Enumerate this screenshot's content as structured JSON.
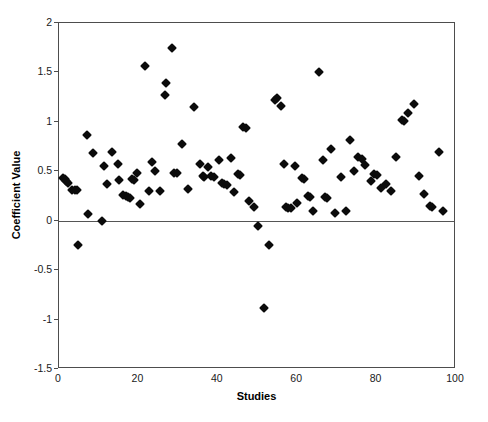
{
  "chart_data": {
    "type": "scatter",
    "title": "",
    "xlabel": "Studies",
    "ylabel": "Coefficient Value",
    "xlim": [
      0,
      100
    ],
    "ylim": [
      -1.5,
      2
    ],
    "xticks": [
      0,
      20,
      40,
      60,
      80,
      100
    ],
    "yticks": [
      -1.5,
      -1,
      -0.5,
      0,
      0.5,
      1,
      1.5,
      2
    ],
    "ytick_labels": [
      "-1.5",
      "-1",
      "-0.5",
      "0",
      "0.5",
      "1",
      "1.5",
      "2"
    ],
    "xtick_labels": [
      "0",
      "20",
      "40",
      "60",
      "80",
      "100"
    ],
    "grid": false,
    "legend": null,
    "marker": "diamond",
    "marker_color": "#0b0b0b",
    "zero_reference_line": 0,
    "series": [
      {
        "name": "Coefficient Value",
        "points": [
          [
            1.0,
            0.43
          ],
          [
            1.4,
            0.42
          ],
          [
            1.8,
            0.4
          ],
          [
            2.2,
            0.38
          ],
          [
            3.4,
            0.31
          ],
          [
            4.0,
            0.31
          ],
          [
            4.6,
            0.31
          ],
          [
            4.8,
            -0.25
          ],
          [
            7.0,
            0.87
          ],
          [
            7.2,
            0.07
          ],
          [
            8.6,
            0.69
          ],
          [
            10.8,
            0.0
          ],
          [
            11.4,
            0.55
          ],
          [
            12.0,
            0.37
          ],
          [
            13.4,
            0.7
          ],
          [
            14.8,
            0.57
          ],
          [
            15.2,
            0.41
          ],
          [
            16.2,
            0.26
          ],
          [
            16.8,
            0.25
          ],
          [
            17.4,
            0.24
          ],
          [
            17.8,
            0.23
          ],
          [
            18.4,
            0.42
          ],
          [
            19.0,
            0.41
          ],
          [
            19.6,
            0.48
          ],
          [
            20.4,
            0.17
          ],
          [
            21.6,
            1.57
          ],
          [
            22.6,
            0.3
          ],
          [
            23.4,
            0.59
          ],
          [
            24.2,
            0.5
          ],
          [
            25.4,
            0.3
          ],
          [
            26.6,
            1.27
          ],
          [
            27.0,
            1.39
          ],
          [
            28.4,
            1.75
          ],
          [
            29.0,
            0.48
          ],
          [
            29.6,
            0.48
          ],
          [
            31.0,
            0.78
          ],
          [
            32.4,
            0.32
          ],
          [
            34.0,
            1.15
          ],
          [
            35.4,
            0.57
          ],
          [
            36.2,
            0.45
          ],
          [
            36.6,
            0.44
          ],
          [
            37.6,
            0.54
          ],
          [
            38.4,
            0.45
          ],
          [
            39.0,
            0.44
          ],
          [
            40.2,
            0.61
          ],
          [
            41.0,
            0.38
          ],
          [
            41.6,
            0.37
          ],
          [
            42.2,
            0.36
          ],
          [
            43.2,
            0.63
          ],
          [
            44.2,
            0.29
          ],
          [
            45.0,
            0.47
          ],
          [
            45.6,
            0.46
          ],
          [
            46.4,
            0.95
          ],
          [
            47.0,
            0.94
          ],
          [
            47.8,
            0.2
          ],
          [
            49.0,
            0.14
          ],
          [
            50.2,
            -0.05
          ],
          [
            51.6,
            -0.88
          ],
          [
            53.0,
            -0.25
          ],
          [
            54.4,
            1.22
          ],
          [
            55.0,
            1.24
          ],
          [
            55.8,
            1.16
          ],
          [
            56.6,
            0.57
          ],
          [
            57.2,
            0.14
          ],
          [
            57.8,
            0.13
          ],
          [
            58.4,
            0.13
          ],
          [
            59.4,
            0.55
          ],
          [
            60.0,
            0.18
          ],
          [
            61.2,
            0.43
          ],
          [
            61.8,
            0.42
          ],
          [
            62.6,
            0.25
          ],
          [
            63.2,
            0.24
          ],
          [
            64.0,
            0.1
          ],
          [
            65.6,
            1.5
          ],
          [
            66.4,
            0.61
          ],
          [
            67.0,
            0.24
          ],
          [
            67.6,
            0.23
          ],
          [
            68.4,
            0.73
          ],
          [
            69.6,
            0.08
          ],
          [
            71.0,
            0.44
          ],
          [
            72.2,
            0.1
          ],
          [
            73.4,
            0.82
          ],
          [
            74.2,
            0.5
          ],
          [
            75.4,
            0.64
          ],
          [
            76.2,
            0.62
          ],
          [
            77.0,
            0.56
          ],
          [
            78.6,
            0.4
          ],
          [
            79.4,
            0.47
          ],
          [
            80.0,
            0.46
          ],
          [
            81.0,
            0.33
          ],
          [
            82.4,
            0.37
          ],
          [
            83.6,
            0.3
          ],
          [
            85.0,
            0.64
          ],
          [
            86.4,
            1.02
          ],
          [
            86.8,
            1.01
          ],
          [
            88.0,
            1.09
          ],
          [
            89.4,
            1.18
          ],
          [
            90.6,
            0.45
          ],
          [
            92.0,
            0.27
          ],
          [
            93.4,
            0.15
          ],
          [
            94.0,
            0.14
          ],
          [
            95.6,
            0.7
          ],
          [
            96.8,
            0.1
          ]
        ]
      }
    ]
  },
  "axes": {
    "ylabel_text": "Coefficient Value",
    "xlabel_text": "Studies"
  }
}
